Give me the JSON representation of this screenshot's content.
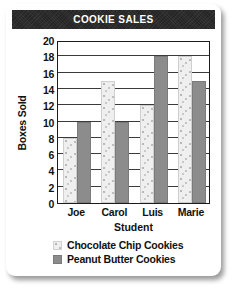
{
  "card": {
    "title": "COOKIE SALES"
  },
  "legend": {
    "items": [
      {
        "label": "Chocolate Chip Cookies",
        "swatch": "choc",
        "color": "#efefef"
      },
      {
        "label": "Peanut Butter Cookies",
        "swatch": "peanut",
        "color": "#8c8c8c"
      }
    ]
  },
  "chart_data": {
    "type": "bar",
    "title": "COOKIE SALES",
    "categories": [
      "Joe",
      "Carol",
      "Luis",
      "Marie"
    ],
    "series": [
      {
        "name": "Chocolate Chip Cookies",
        "values": [
          8,
          15,
          12,
          18
        ]
      },
      {
        "name": "Peanut Butter Cookies",
        "values": [
          10,
          10,
          18,
          15
        ]
      }
    ],
    "xlabel": "Student",
    "ylabel": "Boxes Sold",
    "ylim": [
      0,
      20
    ],
    "ytick_step": 2,
    "yticks": [
      0,
      2,
      4,
      6,
      8,
      10,
      12,
      14,
      16,
      18,
      20
    ],
    "grid": true,
    "legend_position": "bottom"
  }
}
